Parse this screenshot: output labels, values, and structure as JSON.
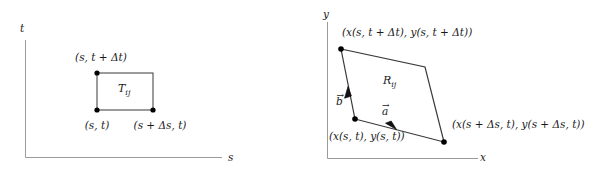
{
  "figure": {
    "caption": "Coordinate rectangle T_ij in the (s,t) parameter plane mapped to the curvilinear region R_ij in the (x,y) plane",
    "line_color": "#3a3a3a",
    "vertex_color": "#000000",
    "axis_color": "#9a9a9a",
    "text_color": "#1a1a1a",
    "background": "#ffffff"
  },
  "left_panel": {
    "name": "parameter-plane-panel",
    "axes": {
      "vertical_label": "t",
      "horizontal_label": "s"
    },
    "region_label": "Tᵢⱼ",
    "region_label_text": "Tij",
    "vertices": [
      {
        "id": "bottom-left",
        "label": "(s, t)",
        "x": 97,
        "y": 110
      },
      {
        "id": "bottom-right",
        "label": "(s + Δs, t)",
        "x": 153,
        "y": 110
      },
      {
        "id": "top-left",
        "label": "(s, t + Δt)",
        "x": 97,
        "y": 73
      },
      {
        "id": "top-right",
        "label": "",
        "x": 153,
        "y": 73
      }
    ],
    "labels": {
      "top_left_vertex": "(s, t + Δt)",
      "bottom_left_vertex": "(s, t)",
      "bottom_right_vertex": "(s + Δs, t)",
      "region": "Tij"
    }
  },
  "right_panel": {
    "name": "image-plane-panel",
    "axes": {
      "vertical_label": "y",
      "horizontal_label": "x"
    },
    "region_label": "Rij",
    "vertices": [
      {
        "id": "bottom-left",
        "label": "(x(s, t), y(s, t))",
        "x": 355,
        "y": 119
      },
      {
        "id": "bottom-right",
        "label": "(x(s + Δs, t), y(s + Δs, t))",
        "x": 444,
        "y": 142
      },
      {
        "id": "top-left",
        "label": "(x(s, t + Δt), y(s, t + Δt))",
        "x": 341,
        "y": 49
      },
      {
        "id": "top-right",
        "label": "",
        "x": 425,
        "y": 67
      }
    ],
    "vectors": [
      {
        "id": "vector-a",
        "label": "a⃗",
        "label_text": "a",
        "from": "bottom-left",
        "to": "bottom-right"
      },
      {
        "id": "vector-b",
        "label": "b⃗",
        "label_text": "b",
        "from": "bottom-left",
        "to": "top-left"
      }
    ],
    "labels": {
      "top_vertex": "(x(s, t + Δt), y(s, t + Δt))",
      "bottom_left_vertex": "(x(s, t), y(s, t))",
      "bottom_right_vertex": "(x(s + Δs, t), y(s + Δs, t))",
      "region": "Rij",
      "vector_a": "a",
      "vector_b": "b"
    }
  }
}
